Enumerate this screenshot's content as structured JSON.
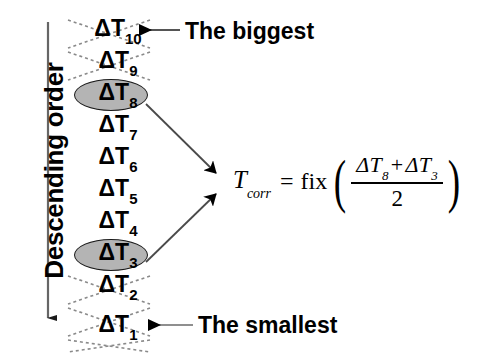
{
  "diagram": {
    "axis": {
      "label": "Descending order",
      "arrow_direction": "down",
      "arrow_color": "#555555"
    },
    "list": {
      "items": [
        {
          "label": "ΔT",
          "subscript": "10",
          "highlighted": false,
          "crossed_out": true
        },
        {
          "label": "ΔT",
          "subscript": "9",
          "highlighted": false,
          "crossed_out": true
        },
        {
          "label": "ΔT",
          "subscript": "8",
          "highlighted": true,
          "crossed_out": false
        },
        {
          "label": "ΔT",
          "subscript": "7",
          "highlighted": false,
          "crossed_out": false
        },
        {
          "label": "ΔT",
          "subscript": "6",
          "highlighted": false,
          "crossed_out": false
        },
        {
          "label": "ΔT",
          "subscript": "5",
          "highlighted": false,
          "crossed_out": false
        },
        {
          "label": "ΔT",
          "subscript": "4",
          "highlighted": false,
          "crossed_out": false
        },
        {
          "label": "ΔT",
          "subscript": "3",
          "highlighted": true,
          "crossed_out": false
        },
        {
          "label": "ΔT",
          "subscript": "2",
          "highlighted": false,
          "crossed_out": true
        },
        {
          "label": "ΔT",
          "subscript": "1",
          "highlighted": false,
          "crossed_out": true
        }
      ],
      "highlight_fill": "#b4b4b4",
      "highlight_stroke": "#1a1a1a",
      "crossout_style": "dotted"
    },
    "annotations": {
      "top": "The biggest",
      "bottom": "The smallest"
    },
    "formula": {
      "lhs_symbol": "T",
      "lhs_subscript": "corr",
      "equals": "=",
      "operator": "fix",
      "open_paren": "(",
      "close_paren": ")",
      "numerator_first_symbol": "ΔT",
      "numerator_first_subscript": "8",
      "numerator_plus": "+",
      "numerator_second_symbol": "ΔT",
      "numerator_second_subscript": "3",
      "denominator": "2"
    }
  }
}
